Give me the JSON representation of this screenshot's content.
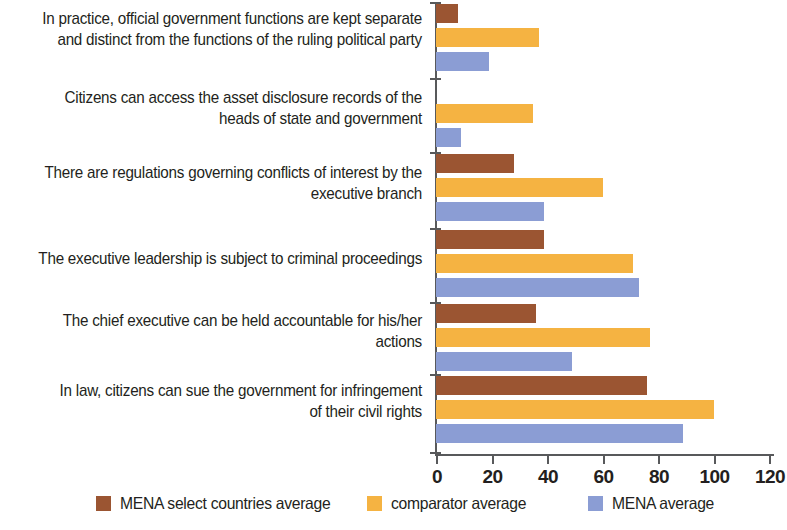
{
  "chart_data": {
    "type": "bar",
    "orientation": "horizontal",
    "title": "",
    "xlabel": "",
    "ylabel": "",
    "xlim": [
      0,
      120
    ],
    "xticks": [
      0,
      20,
      40,
      60,
      80,
      100,
      120
    ],
    "xtick_labels": [
      "0",
      "20",
      "40",
      "60",
      "80",
      "100",
      "120"
    ],
    "grid": false,
    "legend_position": "bottom",
    "categories": [
      "In practice, official government functions are kept separate\nand distinct from the functions of the ruling political party",
      "Citizens can  access the asset disclosure records of the\nheads of state and government",
      "There are regulations governing conflicts of interest by the\nexecutive branch",
      "The executive leadership is subject to criminal proceedings",
      "The chief executive can be held accountable for his/her\nactions",
      "In law, citizens can sue the government for infringement\nof their civil rights"
    ],
    "series": [
      {
        "name": "MENA select countries average",
        "color": "#9b5532",
        "values": [
          8,
          0,
          28,
          39,
          36,
          76
        ]
      },
      {
        "name": "comparator average",
        "color": "#f5b342",
        "values": [
          37,
          35,
          60,
          71,
          77,
          100
        ]
      },
      {
        "name": "MENA average",
        "color": "#8b9dd4",
        "values": [
          19,
          9,
          39,
          73,
          49,
          89
        ]
      }
    ]
  },
  "legend": {
    "entries": [
      {
        "label": "MENA select countries average",
        "color": "#9b5532"
      },
      {
        "label": "comparator average",
        "color": "#f5b342"
      },
      {
        "label": "MENA average",
        "color": "#8b9dd4"
      }
    ]
  }
}
